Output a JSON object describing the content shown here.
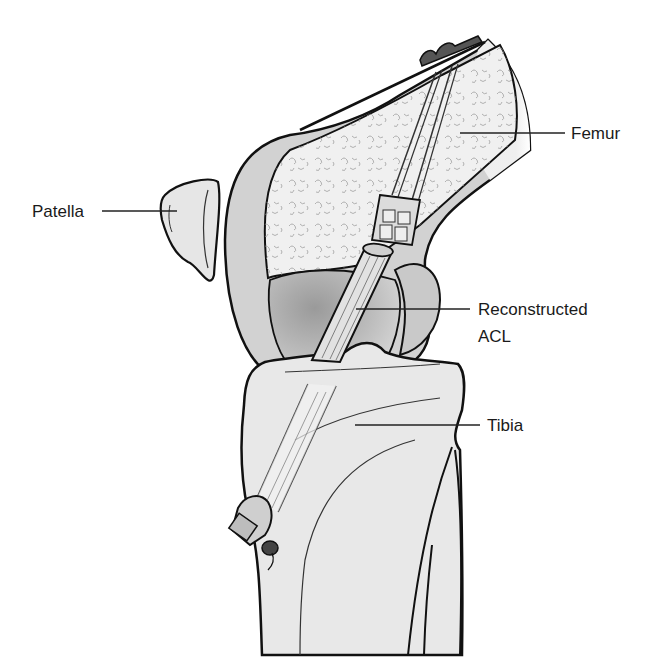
{
  "diagram": {
    "type": "anatomical illustration",
    "colors": {
      "background": "#ffffff",
      "bone_fill": "#e8e8e8",
      "cartilage_fill": "#c4c4c4",
      "cancellous_fill": "#efefef",
      "graft_fill": "#dcdcdc",
      "outline": "#111111",
      "leader_line": "#222222"
    }
  },
  "labels": {
    "femur": "Femur",
    "patella": "Patella",
    "acl_line1": "Reconstructed",
    "acl_line2": "ACL",
    "tibia": "Tibia"
  }
}
